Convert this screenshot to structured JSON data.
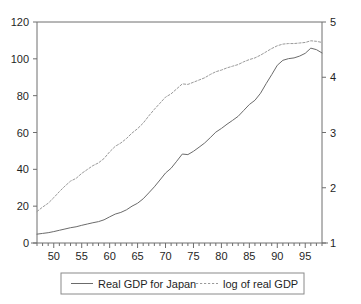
{
  "chart_data": {
    "type": "line",
    "title": "",
    "subtitle": "",
    "xlabel": "",
    "ylabel": "",
    "y2label": "",
    "grid": false,
    "legend_position": "bottom",
    "xlim": [
      47,
      98
    ],
    "ylim": [
      0,
      120
    ],
    "y2lim": [
      1,
      5
    ],
    "x_tick_labels": [
      "50",
      "55",
      "60",
      "65",
      "70",
      "75",
      "80",
      "85",
      "90",
      "95"
    ],
    "x_tick_values": [
      50,
      55,
      60,
      65,
      70,
      75,
      80,
      85,
      90,
      95
    ],
    "x_minor_tick_step": 1,
    "y_tick_labels": [
      "0",
      "20",
      "40",
      "60",
      "80",
      "100",
      "120"
    ],
    "y_tick_values": [
      0,
      20,
      40,
      60,
      80,
      100,
      120
    ],
    "y2_tick_labels": [
      "1",
      "2",
      "3",
      "4",
      "5"
    ],
    "y2_tick_values": [
      1,
      2,
      3,
      4,
      5
    ],
    "x": [
      47,
      48,
      49,
      50,
      51,
      52,
      53,
      54,
      55,
      56,
      57,
      58,
      59,
      60,
      61,
      62,
      63,
      64,
      65,
      66,
      67,
      68,
      69,
      70,
      71,
      72,
      73,
      74,
      75,
      76,
      77,
      78,
      79,
      80,
      81,
      82,
      83,
      84,
      85,
      86,
      87,
      88,
      89,
      90,
      91,
      92,
      93,
      94,
      95,
      96,
      97,
      98
    ],
    "series": [
      {
        "name": "Real GDP for Japan",
        "style": "solid",
        "axis": "left",
        "color": "#6b6b6b",
        "values": [
          4.8,
          5.2,
          5.6,
          6.2,
          6.9,
          7.6,
          8.3,
          8.8,
          9.6,
          10.3,
          11.0,
          11.6,
          12.6,
          14.2,
          15.7,
          16.6,
          18.0,
          20.0,
          21.6,
          24.0,
          27.2,
          30.5,
          34.2,
          38.0,
          40.6,
          44.4,
          48.3,
          48.0,
          49.8,
          52.0,
          54.3,
          57.2,
          60.2,
          62.2,
          64.5,
          66.6,
          68.8,
          72.0,
          75.2,
          77.5,
          81.3,
          86.5,
          91.4,
          96.5,
          99.2,
          100.1,
          100.5,
          101.5,
          103.0,
          105.8,
          105.0,
          103.2
        ]
      },
      {
        "name": "log of real GDP",
        "style": "dotted",
        "axis": "right",
        "color": "#9a9a9a",
        "values": [
          1.57,
          1.65,
          1.72,
          1.82,
          1.93,
          2.03,
          2.12,
          2.17,
          2.26,
          2.33,
          2.4,
          2.45,
          2.53,
          2.65,
          2.75,
          2.81,
          2.89,
          2.99,
          3.07,
          3.17,
          3.3,
          3.42,
          3.53,
          3.64,
          3.7,
          3.79,
          3.88,
          3.87,
          3.91,
          3.95,
          3.99,
          4.05,
          4.1,
          4.13,
          4.17,
          4.2,
          4.23,
          4.28,
          4.32,
          4.35,
          4.4,
          4.46,
          4.52,
          4.57,
          4.6,
          4.61,
          4.61,
          4.62,
          4.63,
          4.66,
          4.65,
          4.63
        ]
      }
    ]
  },
  "legend": {
    "entries": [
      {
        "label": "Real GDP for Japan",
        "style": "solid"
      },
      {
        "label": "log of real GDP",
        "style": "dotted"
      }
    ]
  },
  "axes": {
    "left_ticks": [
      "120",
      "100",
      "80",
      "60",
      "40",
      "20",
      "0"
    ],
    "right_ticks": [
      "5",
      "4",
      "3",
      "2",
      "1"
    ],
    "bottom_ticks": [
      "50",
      "55",
      "60",
      "65",
      "70",
      "75",
      "80",
      "85",
      "90",
      "95"
    ]
  },
  "colors": {
    "background": "#ffffff",
    "axis": "#6e6e6e",
    "text": "#1f1f1f",
    "series_solid": "#6b6b6b",
    "series_dotted": "#9a9a9a",
    "legend_border": "#8a8a8a"
  }
}
